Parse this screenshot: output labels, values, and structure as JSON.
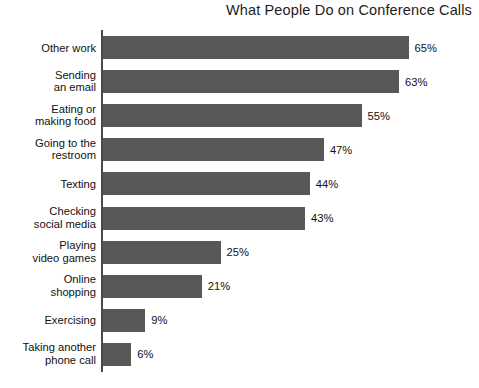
{
  "chart": {
    "title": "What People Do on Conference Calls",
    "value_suffix": "%",
    "bar_color": "#585858",
    "axis_color": "#4a4a4a",
    "background_color": "#ffffff",
    "text_color": "#111111"
  },
  "chart_data": {
    "type": "bar",
    "orientation": "horizontal",
    "title": "What People Do on Conference Calls",
    "xlabel": "",
    "ylabel": "",
    "xlim": [
      0,
      65
    ],
    "grid": false,
    "legend": false,
    "data_labels": true,
    "categories": [
      "Other work",
      "Sending\nan email",
      "Eating or\nmaking food",
      "Going to the\nrestroom",
      "Texting",
      "Checking\nsocial media",
      "Playing\nvideo games",
      "Online\nshopping",
      "Exercising",
      "Taking another\nphone call"
    ],
    "values": [
      65,
      63,
      55,
      47,
      44,
      43,
      25,
      21,
      9,
      6
    ],
    "value_labels": [
      "65%",
      "63%",
      "55%",
      "47%",
      "44%",
      "43%",
      "25%",
      "21%",
      "9%",
      "6%"
    ]
  },
  "bars": [
    {
      "label": "Other work",
      "value": 65,
      "value_label": "65%"
    },
    {
      "label": "Sending\nan email",
      "value": 63,
      "value_label": "63%"
    },
    {
      "label": "Eating or\nmaking food",
      "value": 55,
      "value_label": "55%"
    },
    {
      "label": "Going to the\nrestroom",
      "value": 47,
      "value_label": "47%"
    },
    {
      "label": "Texting",
      "value": 44,
      "value_label": "44%"
    },
    {
      "label": "Checking\nsocial media",
      "value": 43,
      "value_label": "43%"
    },
    {
      "label": "Playing\nvideo games",
      "value": 25,
      "value_label": "25%"
    },
    {
      "label": "Online\nshopping",
      "value": 21,
      "value_label": "21%"
    },
    {
      "label": "Exercising",
      "value": 9,
      "value_label": "9%"
    },
    {
      "label": "Taking another\nphone call",
      "value": 6,
      "value_label": "6%"
    }
  ]
}
